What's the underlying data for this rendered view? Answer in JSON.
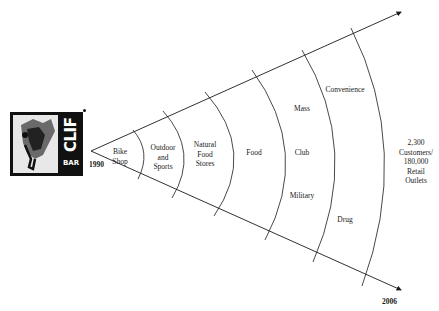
{
  "logo": {
    "brand_top": "CLIF",
    "brand_bottom": "BAR"
  },
  "timeline": {
    "start_year": "1990",
    "end_year": "2006"
  },
  "segments": [
    {
      "lines": [
        "Bike",
        "Shop"
      ]
    },
    {
      "lines": [
        "Outdoor",
        "and",
        "Sports"
      ]
    },
    {
      "lines": [
        "Natural",
        "Food",
        "Stores"
      ]
    },
    {
      "lines": [
        "Food"
      ]
    },
    {
      "upper": "Mass",
      "middle": "Club",
      "lower": "Military"
    },
    {
      "upper": "Convenience",
      "lower": "Drug"
    }
  ],
  "result": {
    "lines": [
      "2,300",
      "Customers/",
      "180,000",
      "Retail",
      "Outlets"
    ]
  },
  "colors": {
    "line": "#1a1a1a",
    "background": "#ffffff"
  }
}
